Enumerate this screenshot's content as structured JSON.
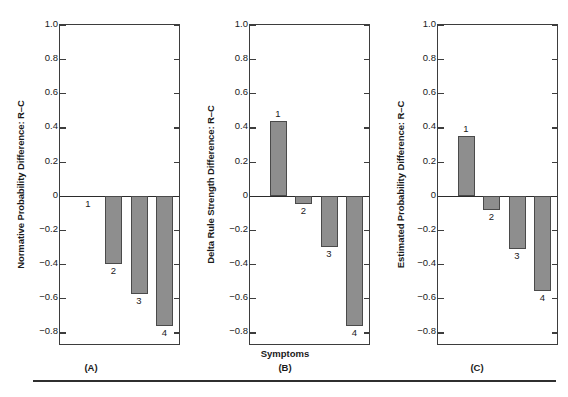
{
  "figure": {
    "shared_xlabel": "Symptoms",
    "categories": [
      "1",
      "2",
      "3",
      "4"
    ],
    "y_ticks": [
      "1.0",
      "0.8",
      "0.6",
      "0.4",
      "0.2",
      "0",
      "−0.2",
      "−0.4",
      "−0.6",
      "−0.8"
    ],
    "y_tick_values": [
      1.0,
      0.8,
      0.6,
      0.4,
      0.2,
      0,
      -0.2,
      -0.4,
      -0.6,
      -0.8
    ],
    "ylim": [
      -0.88,
      1.0
    ],
    "bar_color": "#8e8e8e",
    "bar_edge_color": "#4a4a4a",
    "axis_color": "#3d3d3d",
    "footnote": ""
  },
  "panels": [
    {
      "letter": "(A)",
      "ylabel": "Normative Probability Difference: R–C",
      "xlabel": "",
      "values": [
        0.0,
        -0.4,
        -0.575,
        -0.76
      ],
      "labels": [
        "1",
        "2",
        "3",
        "4"
      ]
    },
    {
      "letter": "(B)",
      "ylabel": "Delta Rule Strength Difference: R–C",
      "xlabel": "Symptoms",
      "values": [
        0.44,
        -0.05,
        -0.3,
        -0.765
      ],
      "labels": [
        "1",
        "2",
        "3",
        "4"
      ]
    },
    {
      "letter": "(C)",
      "ylabel": "Estimated Probability Difference: R–C",
      "xlabel": "",
      "values": [
        0.35,
        -0.085,
        -0.31,
        -0.56
      ],
      "labels": [
        "1",
        "2",
        "3",
        "4"
      ]
    }
  ],
  "chart_data": {
    "type": "bar",
    "title": "",
    "subtitle": "",
    "xlabel": "Symptoms",
    "categories": [
      "1",
      "2",
      "3",
      "4"
    ],
    "ylim": [
      -0.88,
      1.0
    ],
    "grid": false,
    "legend": "none",
    "panel_layout": "1 row x 3 columns",
    "series": [
      {
        "name": "(A) Normative Probability Difference: R–C",
        "ylabel": "Normative Probability Difference: R–C",
        "values": [
          0.0,
          -0.4,
          -0.575,
          -0.76
        ]
      },
      {
        "name": "(B) Delta Rule Strength Difference: R–C",
        "ylabel": "Delta Rule Strength Difference: R–C",
        "values": [
          0.44,
          -0.05,
          -0.3,
          -0.765
        ]
      },
      {
        "name": "(C) Estimated Probability Difference: R–C",
        "ylabel": "Estimated Probability Difference: R–C",
        "values": [
          0.35,
          -0.085,
          -0.31,
          -0.56
        ]
      }
    ],
    "yticks": [
      1.0,
      0.8,
      0.6,
      0.4,
      0.2,
      0,
      -0.2,
      -0.4,
      -0.6,
      -0.8
    ],
    "ytick_labels": [
      "1.0",
      "0.8",
      "0.6",
      "0.4",
      "0.2",
      "0",
      "−0.2",
      "−0.4",
      "−0.6",
      "−0.8"
    ]
  }
}
